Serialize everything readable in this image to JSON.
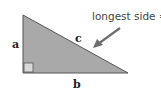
{
  "diagram": {
    "type": "right-triangle",
    "labels": {
      "side_a": "a",
      "side_b": "b",
      "side_c": "c",
      "annotation": "longest side ="
    },
    "colors": {
      "fill": "#a9a9a9",
      "stroke": "#555555",
      "right_angle_fill": "#d9d9d9",
      "arrow": "#6e6e6e",
      "text": "#222222"
    }
  }
}
